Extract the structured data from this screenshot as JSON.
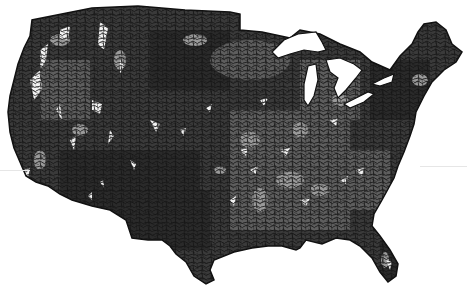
{
  "map": {
    "title": "",
    "region": "Contiguous United States",
    "type": "choropleth",
    "palette": {
      "background": "#ffffff",
      "darkest": "#2e2e2e",
      "dark": "#444444",
      "medium": "#6c6c6c",
      "light": "#a6a6a6",
      "white": "#f4f4f4",
      "border": "#111111",
      "water": "#ffffff"
    },
    "shade_classes": [
      "darkest",
      "dark",
      "medium",
      "light",
      "white"
    ],
    "features": {
      "great_lakes": [
        "Superior",
        "Michigan",
        "Huron",
        "Erie",
        "Ontario"
      ]
    }
  }
}
